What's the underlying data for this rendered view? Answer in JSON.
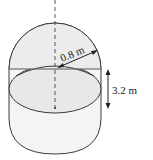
{
  "diagram": {
    "type": "tank: cylinder with hemispherical ends",
    "labels": {
      "radius": "0.8 m",
      "height": "3.2 m"
    },
    "colors": {
      "stroke": "#3a3a3a",
      "fill_light": "#f3f3f3",
      "fill_inner": "#e6e6e6",
      "background": "#ffffff"
    },
    "elements": [
      {
        "name": "axis",
        "style": "dashed vertical"
      },
      {
        "name": "hemisphere-top"
      },
      {
        "name": "cylinder-body"
      },
      {
        "name": "rim-ellipse"
      },
      {
        "name": "radius-arrow",
        "label": "0.8 m"
      },
      {
        "name": "height-arrow",
        "label": "3.2 m"
      }
    ]
  }
}
